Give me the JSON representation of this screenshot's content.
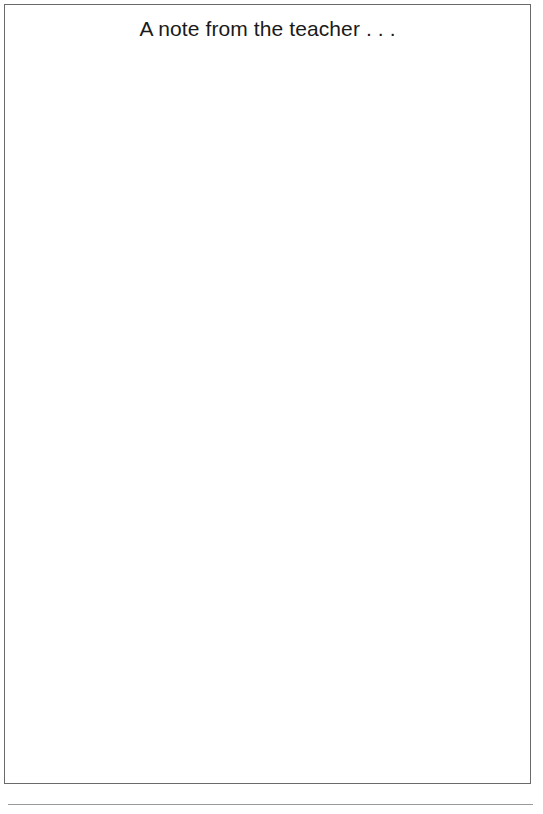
{
  "document": {
    "title": "A note from the teacher . . .",
    "body_text": "",
    "footer_text": ""
  },
  "colors": {
    "border": "#6a6a6a",
    "title_text": "#1a1a1a",
    "footer_rule": "#9a9a9a"
  }
}
